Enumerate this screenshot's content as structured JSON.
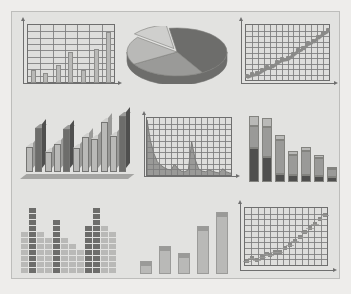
{
  "canvas": {
    "width": 351,
    "height": 294,
    "outer_background": "#eeedeb",
    "panel_background": "#e2e2e0",
    "panel_border": "#bdbdbb",
    "title": "Chart thumbnails collage"
  },
  "palette": {
    "axis": "#6f6f6f",
    "grid": "#7c7c7c",
    "plot_fill": "#dededc",
    "bar_light": "#b9b9b7",
    "bar_medium": "#9a9a98",
    "bar_dark": "#6d6d6b",
    "bar_darkest": "#4f4f4e",
    "bar_pale": "#cfcfcd",
    "marker": "#8a8a88"
  },
  "charts": [
    {
      "id": "bar-grid-chart",
      "name": "column-chart-with-grid",
      "position": "top-left",
      "chart_data": {
        "type": "bar",
        "title": "",
        "xlabel": "",
        "ylabel": "",
        "categories": [
          "1",
          "2",
          "3",
          "4",
          "5",
          "6",
          "7"
        ],
        "values": [
          22,
          17,
          30,
          52,
          22,
          58,
          86
        ],
        "ylim": [
          0,
          100
        ],
        "grid": true,
        "grid_rows": 9,
        "grid_cols": 7,
        "legend": "none"
      }
    },
    {
      "id": "pie-3d-chart",
      "name": "pie-chart-3d-exploded",
      "position": "top-center",
      "chart_data": {
        "type": "pie",
        "title": "",
        "labels": [
          "Segment A",
          "Segment B",
          "Segment C",
          "Segment D"
        ],
        "values": [
          44,
          25,
          19,
          12
        ],
        "exploded_index": 3,
        "three_d": true,
        "legend": "none"
      }
    },
    {
      "id": "scatter-trend-chart",
      "name": "scatter-chart-rising-trend",
      "position": "top-right",
      "chart_data": {
        "type": "scatter",
        "title": "",
        "xlabel": "",
        "ylabel": "",
        "x": [
          2,
          8,
          14,
          20,
          26,
          32,
          38,
          44,
          50,
          56,
          62,
          68,
          74,
          80,
          86,
          92,
          98
        ],
        "y": [
          8,
          12,
          14,
          20,
          24,
          27,
          33,
          38,
          41,
          48,
          54,
          58,
          66,
          71,
          78,
          84,
          90
        ],
        "xlim": [
          0,
          100
        ],
        "ylim": [
          0,
          100
        ],
        "grid": true,
        "grid_rows": 10,
        "grid_cols": 14,
        "trendline": true
      }
    },
    {
      "id": "bar-3d-chart",
      "name": "column-chart-3d",
      "position": "middle-left",
      "chart_data": {
        "type": "bar",
        "title": "",
        "categories": [
          "1",
          "2",
          "3",
          "4",
          "5",
          "6",
          "7",
          "8",
          "9",
          "10",
          "11"
        ],
        "values": [
          42,
          74,
          33,
          46,
          72,
          40,
          58,
          55,
          84,
          60,
          94
        ],
        "ylim": [
          0,
          100
        ],
        "three_d": true,
        "grid": false,
        "series": [
          {
            "name": "alternating-shade",
            "shades": [
              "light",
              "dark",
              "light",
              "light",
              "dark",
              "light",
              "light",
              "light",
              "light",
              "light",
              "dark"
            ]
          }
        ]
      }
    },
    {
      "id": "area-spike-chart",
      "name": "area-chart-with-spikes",
      "position": "middle-center",
      "chart_data": {
        "type": "area",
        "title": "",
        "xlabel": "",
        "ylabel": "",
        "x": [
          0,
          4,
          8,
          12,
          16,
          20,
          24,
          28,
          32,
          36,
          40,
          44,
          48,
          52,
          56,
          60,
          64,
          68,
          72,
          76,
          80,
          84,
          88,
          92,
          96,
          100
        ],
        "y": [
          97,
          62,
          40,
          26,
          20,
          16,
          13,
          12,
          22,
          14,
          10,
          9,
          12,
          60,
          30,
          14,
          10,
          9,
          12,
          10,
          8,
          7,
          14,
          9,
          7,
          6
        ],
        "xlim": [
          0,
          100
        ],
        "ylim": [
          0,
          100
        ],
        "grid": true,
        "grid_rows": 10,
        "grid_cols": 14
      }
    },
    {
      "id": "stacked-bar-chart",
      "name": "stacked-column-chart",
      "position": "middle-right",
      "chart_data": {
        "type": "bar",
        "stacked": true,
        "title": "",
        "categories": [
          "1",
          "2",
          "3",
          "4",
          "5",
          "6",
          "7"
        ],
        "series": [
          {
            "name": "bottom",
            "values": [
              46,
              34,
              11,
              10,
              9,
              8,
              7
            ]
          },
          {
            "name": "middle",
            "values": [
              30,
              40,
              46,
              27,
              33,
              24,
              11
            ]
          },
          {
            "name": "top",
            "values": [
              14,
              12,
              7,
              5,
              5,
              4,
              3
            ]
          }
        ],
        "ylim": [
          0,
          100
        ],
        "grid": false
      }
    },
    {
      "id": "dot-matrix-chart",
      "name": "dot-matrix-histogram",
      "position": "bottom-left",
      "chart_data": {
        "type": "heatmap",
        "title": "",
        "categories": [
          "1",
          "2",
          "3",
          "4",
          "5",
          "6",
          "7",
          "8",
          "9",
          "10",
          "11",
          "12"
        ],
        "values": [
          7,
          11,
          7,
          6,
          9,
          6,
          5,
          4,
          8,
          11,
          8,
          7
        ],
        "ylim": [
          0,
          12
        ],
        "rows": 11,
        "cols": 12,
        "grid": false,
        "shades": [
          "light",
          "dark",
          "light",
          "light",
          "dark",
          "light",
          "light",
          "light",
          "dark",
          "dark",
          "light",
          "light"
        ]
      }
    },
    {
      "id": "bar-simple-chart",
      "name": "column-chart-ascending",
      "position": "bottom-center",
      "chart_data": {
        "type": "bar",
        "title": "",
        "categories": [
          "1",
          "2",
          "3",
          "4",
          "5"
        ],
        "values": [
          18,
          40,
          30,
          68,
          88
        ],
        "ylim": [
          0,
          100
        ],
        "grid": false,
        "cap_shade": "bar_medium"
      }
    },
    {
      "id": "scatter-grid-chart",
      "name": "scatter-chart-with-grid",
      "position": "bottom-right",
      "chart_data": {
        "type": "scatter",
        "title": "",
        "x": [
          3,
          9,
          15,
          21,
          27,
          31,
          37,
          43,
          49,
          55,
          61,
          67,
          73,
          79,
          85,
          91,
          96
        ],
        "y": [
          9,
          13,
          11,
          16,
          20,
          18,
          24,
          23,
          30,
          36,
          42,
          50,
          57,
          64,
          72,
          80,
          86
        ],
        "xlim": [
          0,
          100
        ],
        "ylim": [
          0,
          100
        ],
        "grid": true,
        "grid_rows": 10,
        "grid_cols": 13
      }
    }
  ]
}
